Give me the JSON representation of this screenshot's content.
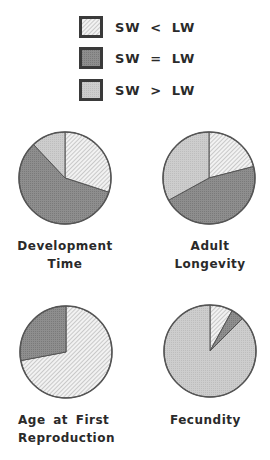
{
  "legend": [
    {
      "label": "SW < LW",
      "pattern": "hatched",
      "color": "#e6e6e6"
    },
    {
      "label": "SW = LW",
      "pattern": "dark",
      "color": "#8a8a8a"
    },
    {
      "label": "SW > LW",
      "pattern": "light",
      "color": "#c8c8c8"
    }
  ],
  "chart_data": {
    "type": "pie",
    "title": "",
    "categories": [
      "SW < LW",
      "SW = LW",
      "SW > LW"
    ],
    "charts": [
      {
        "title": "Development Time",
        "values": [
          30,
          58,
          12
        ]
      },
      {
        "title": "Adult Longevity",
        "values": [
          21,
          46,
          33
        ]
      },
      {
        "title": "Age at First Reproduction",
        "values": [
          72,
          28,
          0
        ]
      },
      {
        "title": "Fecundity",
        "values": [
          8,
          4.5,
          87.5
        ]
      }
    ],
    "legend_position": "top"
  },
  "labels": {
    "dev_line1": "Development",
    "dev_line2": "Time",
    "adult_line1": "Adult",
    "adult_line2": "Longevity",
    "age_line1": "Age at First",
    "age_line2": "Reproduction",
    "fec_line1": "Fecundity"
  }
}
